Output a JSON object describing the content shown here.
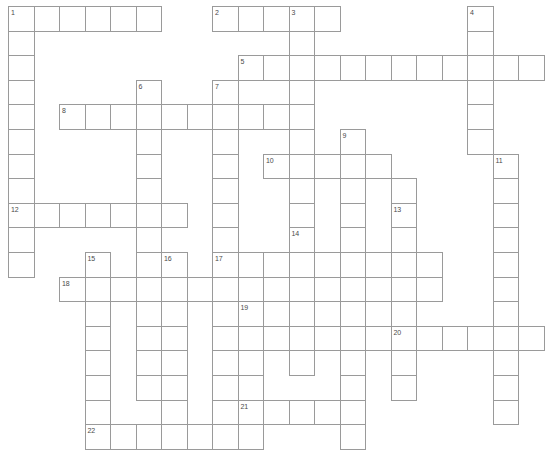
{
  "puzzle": {
    "kind": "crossword-grid",
    "title": "",
    "grid": {
      "origin_x": 8,
      "origin_y": 6,
      "cell_w": 25.5,
      "cell_h": 24.6,
      "cols": 21,
      "rows": 18,
      "line_color": "#9a9a9a",
      "cell_fill": "#ffffff",
      "number_color": "#4a4a4a",
      "background": "#ffffff"
    },
    "entries": [
      {
        "number": "1",
        "row": 0,
        "col": 0,
        "across_len": 6,
        "down_len": 11
      },
      {
        "number": "2",
        "row": 0,
        "col": 8,
        "across_len": 5,
        "down_len": 0
      },
      {
        "number": "3",
        "row": 0,
        "col": 11,
        "across_len": 0,
        "down_len": 14
      },
      {
        "number": "4",
        "row": 0,
        "col": 18,
        "across_len": 0,
        "down_len": 6
      },
      {
        "number": "5",
        "row": 2,
        "col": 9,
        "across_len": 12,
        "down_len": 0
      },
      {
        "number": "6",
        "row": 3,
        "col": 5,
        "across_len": 0,
        "down_len": 13
      },
      {
        "number": "7",
        "row": 3,
        "col": 8,
        "across_len": 0,
        "down_len": 15
      },
      {
        "number": "8",
        "row": 4,
        "col": 2,
        "across_len": 9,
        "down_len": 0
      },
      {
        "number": "9",
        "row": 5,
        "col": 13,
        "across_len": 0,
        "down_len": 13
      },
      {
        "number": "10",
        "row": 6,
        "col": 10,
        "across_len": 5,
        "down_len": 0
      },
      {
        "number": "11",
        "row": 6,
        "col": 19,
        "across_len": 0,
        "down_len": 9
      },
      {
        "number": "12",
        "row": 8,
        "col": 0,
        "across_len": 7,
        "down_len": 0
      },
      {
        "number": "13",
        "row": 8,
        "col": 15,
        "across_len": 0,
        "down_len": 6
      },
      {
        "number": "14",
        "row": 9,
        "col": 11,
        "across_len": 0,
        "down_len": 6
      },
      {
        "number": "15",
        "row": 10,
        "col": 3,
        "across_len": 0,
        "down_len": 7
      },
      {
        "number": "16",
        "row": 10,
        "col": 6,
        "across_len": 0,
        "down_len": 8
      },
      {
        "number": "17",
        "row": 10,
        "col": 8,
        "across_len": 9,
        "down_len": 0
      },
      {
        "number": "18",
        "row": 11,
        "col": 2,
        "across_len": 15,
        "down_len": 0
      },
      {
        "number": "19",
        "row": 12,
        "col": 9,
        "across_len": 0,
        "down_len": 5
      },
      {
        "number": "20",
        "row": 13,
        "col": 15,
        "across_len": 6,
        "down_len": 0
      },
      {
        "number": "21",
        "row": 16,
        "col": 9,
        "across_len": 5,
        "down_len": 0
      },
      {
        "number": "22",
        "row": 17,
        "col": 3,
        "across_len": 7,
        "down_len": 0
      }
    ],
    "cells": [
      [
        0,
        0
      ],
      [
        0,
        1
      ],
      [
        0,
        2
      ],
      [
        0,
        3
      ],
      [
        0,
        4
      ],
      [
        0,
        5
      ],
      [
        0,
        8
      ],
      [
        0,
        9
      ],
      [
        0,
        10
      ],
      [
        0,
        11
      ],
      [
        0,
        12
      ],
      [
        0,
        18
      ],
      [
        1,
        0
      ],
      [
        1,
        18
      ],
      [
        2,
        0
      ],
      [
        2,
        9
      ],
      [
        2,
        10
      ],
      [
        2,
        11
      ],
      [
        2,
        12
      ],
      [
        2,
        13
      ],
      [
        2,
        14
      ],
      [
        2,
        15
      ],
      [
        2,
        16
      ],
      [
        2,
        17
      ],
      [
        2,
        18
      ],
      [
        2,
        19
      ],
      [
        2,
        20
      ],
      [
        3,
        0
      ],
      [
        3,
        5
      ],
      [
        3,
        8
      ],
      [
        3,
        11
      ],
      [
        3,
        18
      ],
      [
        4,
        0
      ],
      [
        4,
        2
      ],
      [
        4,
        3
      ],
      [
        4,
        4
      ],
      [
        4,
        5
      ],
      [
        4,
        6
      ],
      [
        4,
        7
      ],
      [
        4,
        8
      ],
      [
        4,
        9
      ],
      [
        4,
        10
      ],
      [
        4,
        11
      ],
      [
        4,
        18
      ],
      [
        5,
        0
      ],
      [
        5,
        5
      ],
      [
        5,
        8
      ],
      [
        5,
        11
      ],
      [
        5,
        13
      ],
      [
        5,
        18
      ],
      [
        6,
        0
      ],
      [
        6,
        5
      ],
      [
        6,
        8
      ],
      [
        6,
        10
      ],
      [
        6,
        11
      ],
      [
        6,
        12
      ],
      [
        6,
        13
      ],
      [
        6,
        14
      ],
      [
        6,
        19
      ],
      [
        7,
        0
      ],
      [
        7,
        5
      ],
      [
        7,
        8
      ],
      [
        7,
        11
      ],
      [
        7,
        13
      ],
      [
        7,
        15
      ],
      [
        7,
        19
      ],
      [
        8,
        0
      ],
      [
        8,
        1
      ],
      [
        8,
        2
      ],
      [
        8,
        3
      ],
      [
        8,
        4
      ],
      [
        8,
        5
      ],
      [
        8,
        6
      ],
      [
        8,
        8
      ],
      [
        8,
        11
      ],
      [
        8,
        13
      ],
      [
        8,
        15
      ],
      [
        8,
        19
      ],
      [
        9,
        0
      ],
      [
        9,
        5
      ],
      [
        9,
        8
      ],
      [
        9,
        11
      ],
      [
        9,
        13
      ],
      [
        9,
        15
      ],
      [
        9,
        19
      ],
      [
        10,
        0
      ],
      [
        10,
        3
      ],
      [
        10,
        6
      ],
      [
        10,
        8
      ],
      [
        10,
        9
      ],
      [
        10,
        10
      ],
      [
        10,
        11
      ],
      [
        10,
        12
      ],
      [
        10,
        13
      ],
      [
        10,
        14
      ],
      [
        10,
        15
      ],
      [
        10,
        16
      ],
      [
        10,
        19
      ],
      [
        11,
        2
      ],
      [
        11,
        3
      ],
      [
        11,
        4
      ],
      [
        11,
        5
      ],
      [
        11,
        6
      ],
      [
        11,
        7
      ],
      [
        11,
        8
      ],
      [
        11,
        9
      ],
      [
        11,
        10
      ],
      [
        11,
        11
      ],
      [
        11,
        12
      ],
      [
        11,
        13
      ],
      [
        11,
        14
      ],
      [
        11,
        15
      ],
      [
        11,
        16
      ],
      [
        11,
        19
      ],
      [
        12,
        3
      ],
      [
        12,
        6
      ],
      [
        12,
        8
      ],
      [
        12,
        9
      ],
      [
        12,
        11
      ],
      [
        12,
        13
      ],
      [
        12,
        15
      ],
      [
        12,
        19
      ],
      [
        13,
        3
      ],
      [
        13,
        6
      ],
      [
        13,
        8
      ],
      [
        13,
        9
      ],
      [
        13,
        10
      ],
      [
        13,
        11
      ],
      [
        13,
        12
      ],
      [
        13,
        13
      ],
      [
        13,
        14
      ],
      [
        13,
        15
      ],
      [
        13,
        16
      ],
      [
        13,
        17
      ],
      [
        13,
        18
      ],
      [
        13,
        19
      ],
      [
        13,
        20
      ],
      [
        14,
        3
      ],
      [
        14,
        6
      ],
      [
        14,
        8
      ],
      [
        14,
        9
      ],
      [
        14,
        13
      ],
      [
        14,
        15
      ],
      [
        15,
        3
      ],
      [
        15,
        6
      ],
      [
        15,
        8
      ],
      [
        15,
        9
      ],
      [
        15,
        13
      ],
      [
        15,
        15
      ],
      [
        15,
        19
      ],
      [
        16,
        6
      ],
      [
        16,
        8
      ],
      [
        16,
        9
      ],
      [
        16,
        10
      ],
      [
        16,
        11
      ],
      [
        16,
        12
      ],
      [
        16,
        13
      ],
      [
        16,
        19
      ],
      [
        17,
        3
      ],
      [
        17,
        4
      ],
      [
        17,
        5
      ],
      [
        17,
        6
      ],
      [
        17,
        7
      ],
      [
        17,
        8
      ],
      [
        17,
        9
      ],
      [
        17,
        13
      ]
    ]
  }
}
